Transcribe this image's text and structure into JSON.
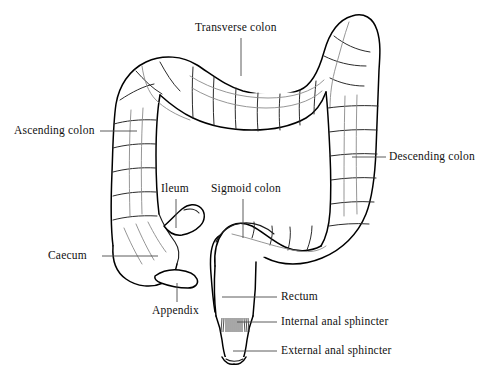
{
  "figure": {
    "background_color": "#ffffff",
    "line_color": "#000000",
    "width": 479,
    "height": 374
  },
  "labels": [
    {
      "id": "transverse-colon",
      "text": "Transverse colon",
      "x": 195,
      "y": 22,
      "leader": {
        "type": "vertical",
        "x1": 241,
        "y1": 38,
        "x2": 241,
        "y2": 76
      }
    },
    {
      "id": "ascending-colon",
      "text": "Ascending colon",
      "x": 14,
      "y": 125,
      "leader": {
        "type": "horizontal",
        "x1": 100,
        "y1": 131,
        "x2": 137,
        "y2": 131
      }
    },
    {
      "id": "descending-colon",
      "text": "Descending colon",
      "x": 389,
      "y": 151,
      "leader": {
        "type": "horizontal",
        "x1": 352,
        "y1": 157,
        "x2": 386,
        "y2": 157
      }
    },
    {
      "id": "ileum",
      "text": "Ileum",
      "x": 161,
      "y": 183,
      "leader": {
        "type": "vertical",
        "x1": 176,
        "y1": 199,
        "x2": 176,
        "y2": 228
      }
    },
    {
      "id": "sigmoid-colon",
      "text": "Sigmoid colon",
      "x": 211,
      "y": 183,
      "leader": {
        "type": "vertical",
        "x1": 243,
        "y1": 199,
        "x2": 243,
        "y2": 238
      }
    },
    {
      "id": "caecum",
      "text": "Caecum",
      "x": 48,
      "y": 250,
      "leader": {
        "type": "horizontal",
        "x1": 102,
        "y1": 256,
        "x2": 158,
        "y2": 256
      }
    },
    {
      "id": "appendix",
      "text": "Appendix",
      "x": 152,
      "y": 305,
      "leader": {
        "type": "vertical",
        "x1": 177,
        "y1": 283,
        "x2": 177,
        "y2": 302
      }
    },
    {
      "id": "rectum",
      "text": "Rectum",
      "x": 281,
      "y": 291,
      "leader": {
        "type": "horizontal",
        "x1": 222,
        "y1": 297,
        "x2": 277,
        "y2": 297
      }
    },
    {
      "id": "internal-anal-sphincter",
      "text": "Internal anal sphincter",
      "x": 281,
      "y": 316,
      "leader": {
        "type": "horizontal",
        "x1": 237,
        "y1": 322,
        "x2": 277,
        "y2": 322
      }
    },
    {
      "id": "external-anal-sphincter",
      "text": "External anal sphincter",
      "x": 281,
      "y": 345,
      "leader": {
        "type": "horizontal",
        "x1": 233,
        "y1": 351,
        "x2": 277,
        "y2": 351
      }
    }
  ],
  "structures": [
    {
      "id": "ascending-colon",
      "name": "Ascending colon"
    },
    {
      "id": "transverse-colon",
      "name": "Transverse colon"
    },
    {
      "id": "descending-colon",
      "name": "Descending colon"
    },
    {
      "id": "sigmoid-colon",
      "name": "Sigmoid colon"
    },
    {
      "id": "caecum",
      "name": "Caecum"
    },
    {
      "id": "appendix",
      "name": "Appendix"
    },
    {
      "id": "ileum",
      "name": "Ileum"
    },
    {
      "id": "rectum",
      "name": "Rectum"
    },
    {
      "id": "internal-anal-sphincter",
      "name": "Internal anal sphincter"
    },
    {
      "id": "external-anal-sphincter",
      "name": "External anal sphincter"
    }
  ]
}
